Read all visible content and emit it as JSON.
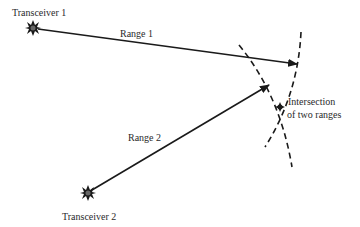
{
  "diagram": {
    "title": "",
    "nodes": [
      {
        "id": "t1",
        "label": "Transceiver 1",
        "icon": "star-burst-icon"
      },
      {
        "id": "t2",
        "label": "Transceiver 2",
        "icon": "star-burst-icon"
      },
      {
        "id": "ix",
        "label_line1": "Intersection",
        "label_line2": "of two ranges"
      }
    ],
    "edges": [
      {
        "from": "t1",
        "label": "Range 1",
        "style": "solid-arrow"
      },
      {
        "from": "t2",
        "label": "Range 2",
        "style": "solid-arrow"
      }
    ],
    "arcs": [
      {
        "name": "range-1-arc",
        "style": "dashed"
      },
      {
        "name": "range-2-arc",
        "style": "dashed"
      }
    ],
    "colors": {
      "stroke": "#1a1a1a",
      "text": "#2a2a2a",
      "background": "#ffffff"
    }
  }
}
